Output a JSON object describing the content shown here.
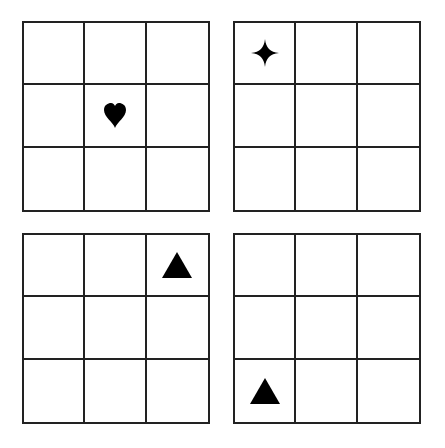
{
  "puzzle": {
    "grids": [
      {
        "position": "top-left",
        "symbol": "heart",
        "row": 2,
        "col": 2
      },
      {
        "position": "top-right",
        "symbol": "four-point-star",
        "row": 1,
        "col": 1
      },
      {
        "position": "bottom-left",
        "symbol": "triangle",
        "row": 1,
        "col": 3
      },
      {
        "position": "bottom-right",
        "symbol": "triangle",
        "row": 3,
        "col": 1
      }
    ],
    "grid_size": "3x3",
    "colors": {
      "lines": "#222222",
      "symbols": "#000000",
      "background": "#ffffff"
    }
  }
}
